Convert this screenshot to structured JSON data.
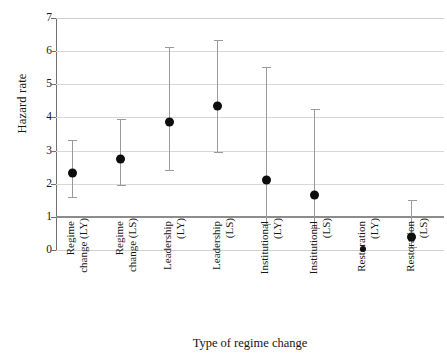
{
  "chart_data": {
    "type": "scatter",
    "title": "",
    "xlabel": "Type of regime change",
    "ylabel": "Hazard rate",
    "ylim": [
      0,
      7
    ],
    "yticks": [
      0,
      1,
      2,
      3,
      4,
      5,
      6,
      7
    ],
    "ytick_labels": [
      "0",
      "1",
      "2",
      "3",
      "4",
      "5",
      "6",
      "7"
    ],
    "grid": true,
    "legend": "none",
    "reference_line": {
      "value": 1,
      "label": "hazard rate = 1",
      "color": "#8c8c8c"
    },
    "marker_color": "#0d0d0d",
    "errorbar_color": "#9a9a9a",
    "gridline_color": "#d8d8d8",
    "categories": [
      "Regime change (LY)",
      "Regime change (LS)",
      "Leadership (LY)",
      "Leadership (LS)",
      "Institutional (LY)",
      "Institutional (LS)",
      "Restoration (LY)",
      "Restoration (LS)"
    ],
    "category_lines": [
      [
        "Regime",
        "change (LY)"
      ],
      [
        "Regime",
        "change (LS)"
      ],
      [
        "Leadership",
        "(LY)"
      ],
      [
        "Leadership",
        "(LS)"
      ],
      [
        "Institutional",
        "(LY)"
      ],
      [
        "Institutional",
        "(LS)"
      ],
      [
        "Restoration",
        "(LY)"
      ],
      [
        "Restoration",
        "(LS)"
      ]
    ],
    "values": [
      2.31,
      2.74,
      3.85,
      4.34,
      2.12,
      1.66,
      0.02,
      0.38
    ],
    "ci_lower": [
      1.59,
      1.95,
      2.4,
      2.97,
      0.78,
      0.65,
      0.02,
      0.08
    ],
    "ci_upper": [
      3.33,
      3.94,
      6.12,
      6.34,
      5.53,
      4.24,
      0.02,
      1.52
    ]
  }
}
